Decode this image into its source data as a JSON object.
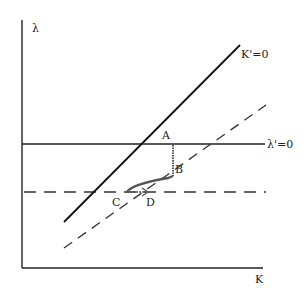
{
  "diagram": {
    "type": "phase-diagram",
    "axes": {
      "y_label": "λ",
      "x_label": "K"
    },
    "curves": {
      "k_dot_zero": {
        "label": "K'=0",
        "style": "solid"
      },
      "lambda_dot_zero": {
        "label": "λ'=0",
        "style": "solid"
      },
      "k_dot_zero_shifted": {
        "label": "",
        "style": "dashed"
      },
      "lambda_dot_zero_shifted": {
        "label": "",
        "style": "dashed"
      }
    },
    "points": {
      "a": "A",
      "b": "B",
      "c": "C",
      "d": "D"
    },
    "colors": {
      "line": "#222222",
      "path": "#555555",
      "background": "#ffffff"
    }
  }
}
